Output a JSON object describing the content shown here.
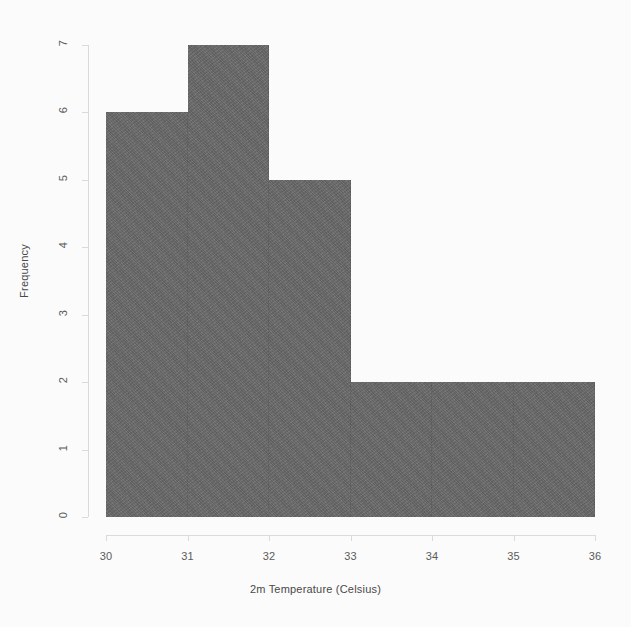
{
  "chart_data": {
    "type": "bar",
    "subtype": "histogram",
    "title": "",
    "xlabel": "2m Temperature (Celsius)",
    "ylabel": "Frequency",
    "xlim": [
      30,
      36
    ],
    "ylim": [
      0,
      7
    ],
    "bin_width": 1,
    "grid": false,
    "legend": null,
    "bar_color": "#6a6a6a",
    "axis_color": "#dcdcdc",
    "background_color": "#fdfdfd",
    "bins": [
      {
        "range": "30-31",
        "start": 30,
        "end": 31,
        "frequency": 6
      },
      {
        "range": "31-32",
        "start": 31,
        "end": 32,
        "frequency": 7
      },
      {
        "range": "32-33",
        "start": 32,
        "end": 33,
        "frequency": 5
      },
      {
        "range": "33-34",
        "start": 33,
        "end": 34,
        "frequency": 2
      },
      {
        "range": "34-35",
        "start": 34,
        "end": 35,
        "frequency": 2
      },
      {
        "range": "35-36",
        "start": 35,
        "end": 36,
        "frequency": 2
      }
    ],
    "categories": [
      "30-31",
      "31-32",
      "32-33",
      "33-34",
      "34-35",
      "35-36"
    ],
    "values": [
      6,
      7,
      5,
      2,
      2,
      2
    ],
    "x_ticks": [
      {
        "value": 30,
        "label": "30"
      },
      {
        "value": 31,
        "label": "31"
      },
      {
        "value": 32,
        "label": "32"
      },
      {
        "value": 33,
        "label": "33"
      },
      {
        "value": 34,
        "label": "34"
      },
      {
        "value": 35,
        "label": "35"
      },
      {
        "value": 36,
        "label": "36"
      }
    ],
    "y_ticks": [
      {
        "value": 0,
        "label": "0"
      },
      {
        "value": 1,
        "label": "1"
      },
      {
        "value": 2,
        "label": "2"
      },
      {
        "value": 3,
        "label": "3"
      },
      {
        "value": 4,
        "label": "4"
      },
      {
        "value": 5,
        "label": "5"
      },
      {
        "value": 6,
        "label": "6"
      },
      {
        "value": 7,
        "label": "7"
      }
    ]
  }
}
